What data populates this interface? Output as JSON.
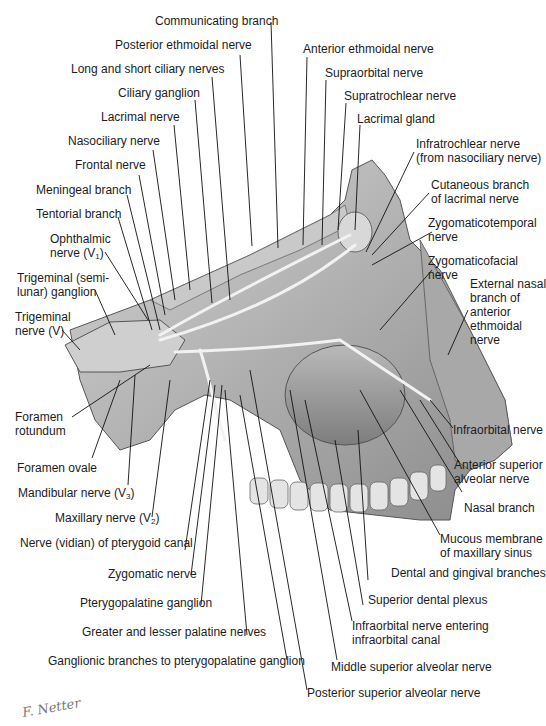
{
  "figure": {
    "signature": "F. Netter",
    "colors": {
      "background": "#ffffff",
      "illustration_gray": "#9a9a9a",
      "bone": "#c8c8c8",
      "nerve": "#eeeeee",
      "leader_line": "#111111",
      "text": "#1c1c1c"
    }
  },
  "labels": {
    "top": [
      {
        "id": "communicating-branch",
        "text": "Communicating branch"
      },
      {
        "id": "posterior-ethmoidal-nerve",
        "text": "Posterior ethmoidal nerve"
      },
      {
        "id": "long-short-ciliary-nerves",
        "text": "Long and short ciliary nerves"
      },
      {
        "id": "ciliary-ganglion",
        "text": "Ciliary ganglion"
      },
      {
        "id": "lacrimal-nerve",
        "text": "Lacrimal nerve"
      },
      {
        "id": "nasociliary-nerve",
        "text": "Nasociliary nerve"
      },
      {
        "id": "frontal-nerve",
        "text": "Frontal nerve"
      }
    ],
    "top_right": [
      {
        "id": "anterior-ethmoidal-nerve",
        "text": "Anterior ethmoidal nerve"
      },
      {
        "id": "supraorbital-nerve",
        "text": "Supraorbital nerve"
      },
      {
        "id": "supratrochlear-nerve",
        "text": "Supratrochlear nerve"
      },
      {
        "id": "lacrimal-gland",
        "text": "Lacrimal gland"
      }
    ],
    "right": [
      {
        "id": "infratrochlear-nerve",
        "line1": "Infratrochlear nerve",
        "line2": "(from nasociliary nerve)"
      },
      {
        "id": "cutaneous-branch-lacrimal",
        "line1": "Cutaneous branch",
        "line2": "of lacrimal nerve"
      },
      {
        "id": "zygomaticotemporal-nerve",
        "line1": "Zygomaticotemporal",
        "line2": "nerve"
      },
      {
        "id": "zygomaticofacial-nerve",
        "line1": "Zygomaticofacial",
        "line2": "nerve"
      },
      {
        "id": "external-nasal-branch",
        "line1": "External nasal",
        "line2": "branch of",
        "line3": "anterior",
        "line4": "ethmoidal",
        "line5": "nerve"
      },
      {
        "id": "infraorbital-nerve",
        "text": "Infraorbital nerve"
      },
      {
        "id": "anterior-superior-alveolar",
        "line1": "Anterior superior",
        "line2": "alveolar nerve"
      },
      {
        "id": "nasal-branch",
        "text": "Nasal branch"
      },
      {
        "id": "mucous-membrane",
        "line1": "Mucous membrane",
        "line2": "of maxillary sinus"
      }
    ],
    "left": [
      {
        "id": "meningeal-branch",
        "text": "Meningeal branch"
      },
      {
        "id": "tentorial-branch",
        "text": "Tentorial branch"
      },
      {
        "id": "ophthalmic-nerve",
        "line1": "Ophthalmic",
        "line2": "nerve (V",
        "sub": "1",
        "line2_end": ")"
      },
      {
        "id": "trigeminal-ganglion",
        "line1": "Trigeminal (semi-",
        "line2": "lunar) ganglion"
      },
      {
        "id": "trigeminal-nerve",
        "line1": "Trigeminal",
        "line2": "nerve (V)"
      },
      {
        "id": "foramen-rotundum",
        "line1": "Foramen",
        "line2": "rotundum"
      },
      {
        "id": "foramen-ovale",
        "text": "Foramen ovale"
      },
      {
        "id": "mandibular-nerve",
        "text": "Mandibular nerve (V",
        "sub": "3",
        "end": ")"
      },
      {
        "id": "maxillary-nerve",
        "text": "Maxillary nerve (V",
        "sub": "2",
        "end": ")"
      },
      {
        "id": "nerve-pterygoid-canal",
        "text": "Nerve (vidian) of pterygoid canal"
      }
    ],
    "bottom": [
      {
        "id": "zygomatic-nerve",
        "text": "Zygomatic nerve"
      },
      {
        "id": "pterygopalatine-ganglion",
        "text": "Pterygopalatine ganglion"
      },
      {
        "id": "palatine-nerves",
        "text": "Greater and lesser palatine nerves"
      },
      {
        "id": "ganglionic-branches",
        "text": "Ganglionic branches to pterygopalatine ganglion"
      },
      {
        "id": "dental-gingival-branches",
        "text": "Dental and gingival branches"
      },
      {
        "id": "superior-dental-plexus",
        "text": "Superior dental plexus"
      },
      {
        "id": "infraorbital-entering",
        "line1": "Infraorbital nerve entering",
        "line2": "infraorbital canal"
      },
      {
        "id": "middle-superior-alveolar",
        "text": "Middle superior alveolar nerve"
      },
      {
        "id": "posterior-superior-alveolar",
        "text": "Posterior superior alveolar nerve"
      }
    ]
  }
}
